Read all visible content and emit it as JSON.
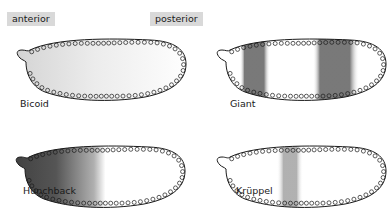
{
  "axis": {
    "anterior": "anterior",
    "posterior": "posterior"
  },
  "panels": [
    {
      "gene": "Bicoid",
      "pattern": "faint anterior-to-posterior gradient"
    },
    {
      "gene": "Giant",
      "pattern": "two stripes: anterior band and posterior band"
    },
    {
      "gene": "Hunchback",
      "pattern": "strong anterior gradient fading by mid-embryo"
    },
    {
      "gene": "Krüppel",
      "pattern": "single central stripe"
    }
  ],
  "colors": {
    "label_bg": "#d9d9d9",
    "outline": "#1a1a1a",
    "stain": "#555555"
  }
}
